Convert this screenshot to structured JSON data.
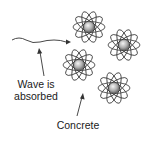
{
  "labels": {
    "wave_line1": "Wave is",
    "wave_line2": "absorbed",
    "concrete": "Concrete"
  },
  "atoms": [
    {
      "name": "atom-top",
      "cx": 89,
      "cy": 27
    },
    {
      "name": "atom-right",
      "cx": 124,
      "cy": 45
    },
    {
      "name": "atom-middle",
      "cx": 79,
      "cy": 65
    },
    {
      "name": "atom-bottom-right",
      "cx": 114,
      "cy": 88
    }
  ],
  "colors": {
    "stroke": "#333333",
    "nucleus_light": "#f2f2f2",
    "nucleus_dark": "#7a7a7a"
  }
}
